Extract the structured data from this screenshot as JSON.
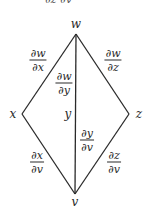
{
  "diagram": {
    "type": "tree-diagram",
    "top_fragment": {
      "text": "∂z   ∂v"
    },
    "nodes": {
      "w": {
        "label": "w",
        "x": 76,
        "y": 34
      },
      "x": {
        "label": "x",
        "x": 22,
        "y": 114
      },
      "y": {
        "label": "y",
        "x": 76,
        "y": 114
      },
      "z": {
        "label": "z",
        "x": 129,
        "y": 114
      },
      "v": {
        "label": "v",
        "x": 75,
        "y": 194
      }
    },
    "edges": [
      {
        "from": "w",
        "to": "x",
        "label": {
          "num": "∂w",
          "den": "∂x"
        }
      },
      {
        "from": "w",
        "to": "y",
        "label": {
          "num": "∂w",
          "den": "∂y"
        }
      },
      {
        "from": "w",
        "to": "z",
        "label": {
          "num": "∂w",
          "den": "∂z"
        }
      },
      {
        "from": "x",
        "to": "v",
        "label": {
          "num": "∂x",
          "den": "∂v"
        }
      },
      {
        "from": "y",
        "to": "v",
        "label": {
          "num": "∂y",
          "den": "∂v"
        }
      },
      {
        "from": "z",
        "to": "v",
        "label": {
          "num": "∂z",
          "den": "∂v"
        }
      }
    ],
    "colors": {
      "line": "#2a2a2a",
      "text": "#2a2a2a",
      "background": "#ffffff"
    }
  }
}
